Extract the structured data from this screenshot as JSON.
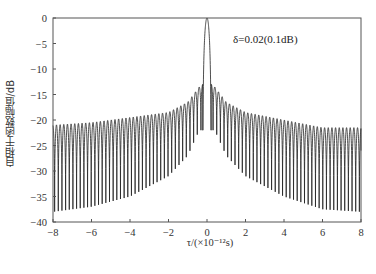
{
  "chart_data": {
    "type": "line",
    "title": "",
    "xlabel": "τ/(×10⁻¹²s)",
    "ylabel": "自相干函数幅值/dB",
    "xlim": [
      -8,
      8
    ],
    "ylim": [
      -40,
      0
    ],
    "xticks": [
      -8,
      -6,
      -4,
      -2,
      0,
      2,
      4,
      6,
      8
    ],
    "yticks": [
      0,
      -5,
      -10,
      -15,
      -20,
      -25,
      -30,
      -35,
      -40
    ],
    "grid": false,
    "legend": null,
    "annotation": "δ=0.02(0.1dB)",
    "series": [
      {
        "name": "autocorrelation",
        "color": "#222222",
        "description": "Main lobe peak 0 dB at τ=0; dense oscillating side lobes with ~0.19 spacing",
        "main_peak": {
          "x": 0,
          "y": 0
        },
        "first_sidelobe": {
          "x": 0.3,
          "y": -13
        },
        "lobe_spacing": 0.19,
        "peak_envelope": {
          "x": [
            -8,
            -6,
            -4,
            -2,
            -1,
            -0.3,
            0.3,
            1,
            2,
            4,
            6,
            8
          ],
          "y": [
            -21,
            -20.5,
            -19.5,
            -18.5,
            -16.5,
            -13,
            -13,
            -16.5,
            -18.5,
            -20,
            -21.5,
            -21.5
          ]
        },
        "null_envelope": {
          "x": [
            -8,
            -6,
            -4,
            -2,
            -1,
            -0.4,
            0.4,
            1,
            2,
            4,
            6,
            8
          ],
          "y": [
            -38,
            -37,
            -35,
            -31,
            -27,
            -22,
            -22,
            -27,
            -31,
            -35,
            -37.5,
            -38
          ]
        },
        "end_value": {
          "x": 8,
          "y": -26
        }
      }
    ]
  },
  "labels": {
    "ylabel": "自相干函数幅值/dB",
    "xlabel": "τ/(×10⁻¹²s)",
    "annotation": "δ=0.02(0.1dB)"
  }
}
